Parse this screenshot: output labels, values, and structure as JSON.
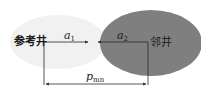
{
  "diagram": {
    "reference_well": {
      "label": "参考井",
      "fill": "#f1f1f1"
    },
    "adjacent_well": {
      "label": "邻井",
      "fill": "#7f7f7f"
    },
    "arrow_a1": {
      "var": "a",
      "sub": "1"
    },
    "arrow_a2": {
      "var": "a",
      "sub": "2"
    },
    "distance": {
      "var": "p",
      "sub": "mn"
    },
    "line_color": "#2a2a2a"
  }
}
